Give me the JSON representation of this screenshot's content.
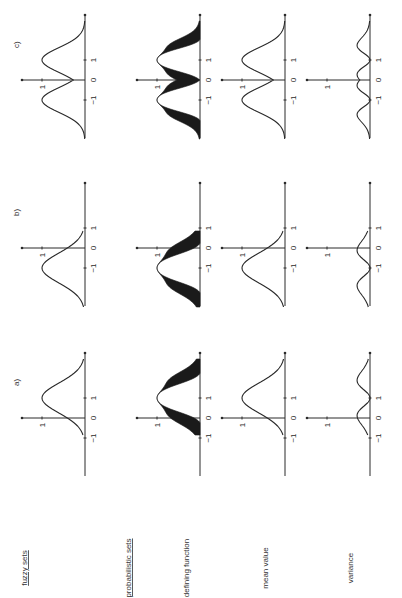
{
  "figure": {
    "orientation": "rotated 90 degrees counter-clockwise",
    "row_labels": [
      {
        "key": "fuzzy",
        "text": "fuzzy sets",
        "underlined": true
      },
      {
        "key": "prob",
        "text": "probabilistic sets",
        "underlined": true
      },
      {
        "key": "defining",
        "text": "defining function",
        "underlined": false
      },
      {
        "key": "mean",
        "text": "mean value",
        "underlined": false
      },
      {
        "key": "variance",
        "text": "variance",
        "underlined": false
      }
    ],
    "column_labels": [
      "a)",
      "b)",
      "c)"
    ],
    "tick_labels": {
      "minus_one": "−1",
      "zero": "0",
      "one": "1",
      "y_one": "1"
    }
  },
  "chart_data": {
    "type": "line",
    "layout": "grid 4 rows x 3 columns (rows: fuzzy sets membership, probabilistic-set defining function band, mean value, variance; columns a, b, c)",
    "x_ticks": [
      -1,
      0,
      1
    ],
    "y_ticks": [
      1
    ],
    "xlim": [
      -2.8,
      3.0
    ],
    "ylim": [
      0,
      1.15
    ],
    "panels": [
      {
        "column": "a)",
        "row": "fuzzy sets",
        "shape": "bell centered at x=1, peak 1, support approx [-0.8, 2.9]"
      },
      {
        "column": "b)",
        "row": "fuzzy sets",
        "shape": "bell centered at x=-1, peak 1, support approx [-2.9, 0.8]"
      },
      {
        "column": "c)",
        "row": "fuzzy sets",
        "shape": "two bells centered at x=-1 and x=1, peak 1, dip to approx 0.45 at x=0"
      },
      {
        "column": "a)",
        "row": "defining function",
        "shape": "filled band around bell at x=1, width 0 at peak, widest on flanks"
      },
      {
        "column": "b)",
        "row": "defining function",
        "shape": "filled band around bell at x=-1"
      },
      {
        "column": "c)",
        "row": "defining function",
        "shape": "filled band around double bell at x=-1 and x=1"
      },
      {
        "column": "a)",
        "row": "mean value",
        "shape": "bell centered at x=1, peak 1"
      },
      {
        "column": "b)",
        "row": "mean value",
        "shape": "bell centered at x=-1, peak 1"
      },
      {
        "column": "c)",
        "row": "mean value",
        "shape": "double bell at x=-1 and x=1, dip approx 0.45 at x=0"
      },
      {
        "column": "a)",
        "row": "variance",
        "shape": "small humps, zero at x=1 (peak of mean), max approx 0.3"
      },
      {
        "column": "b)",
        "row": "variance",
        "shape": "small humps, zero at x=-1, max approx 0.3"
      },
      {
        "column": "c)",
        "row": "variance",
        "shape": "small humps, zero at x=-1 and x=1, max approx 0.3"
      }
    ]
  }
}
